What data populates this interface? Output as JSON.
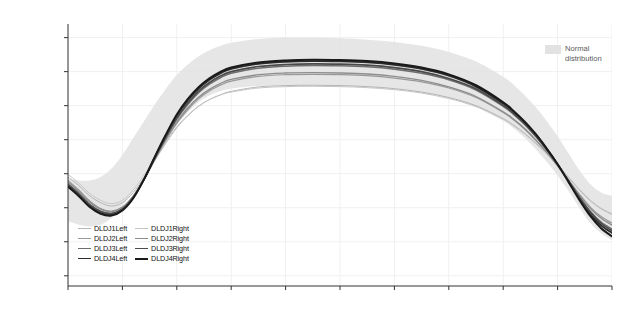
{
  "chart_data": {
    "type": "line",
    "title": "",
    "xlabel": "Percent of movement cycle",
    "ylabel": "Ankle angles (sagittal)\n(-) plantarflexion; (+) dorsiflexion",
    "ylabel_line1": "Ankle angles (sagittal)",
    "ylabel_line2": "(-) plantarflexion; (+) dorsiflexion",
    "xlim": [
      0,
      100
    ],
    "ylim": [
      -33,
      44
    ],
    "xticks": [
      0,
      10,
      20,
      30,
      40,
      50,
      60,
      70,
      80,
      90,
      100
    ],
    "yticks": [
      -30,
      -20,
      -10,
      0,
      10,
      20,
      30,
      40
    ],
    "grid": true,
    "legend_position": "bottom-left",
    "x": [
      0,
      2,
      4,
      6,
      8,
      10,
      12,
      14,
      16,
      18,
      20,
      22,
      24,
      26,
      28,
      30,
      35,
      40,
      45,
      50,
      55,
      60,
      65,
      70,
      75,
      80,
      82,
      84,
      86,
      88,
      90,
      92,
      94,
      96,
      98,
      100
    ],
    "band": {
      "name": "Normal distribution",
      "color": "#e2e2e2",
      "upper": [
        -1.5,
        -2.0,
        -2.0,
        -1.0,
        1.5,
        5.5,
        10.5,
        15.5,
        20.5,
        25.0,
        29.0,
        32.0,
        34.5,
        36.3,
        37.6,
        38.5,
        39.6,
        40.0,
        40.0,
        39.8,
        39.4,
        38.7,
        37.6,
        35.8,
        33.0,
        28.5,
        26.0,
        23.0,
        19.5,
        15.5,
        11.0,
        6.0,
        1.0,
        -3.0,
        -5.5,
        -6.5
      ],
      "lower": [
        -14.0,
        -15.0,
        -15.5,
        -15.0,
        -13.0,
        -9.5,
        -5.0,
        0.0,
        5.0,
        10.0,
        14.5,
        18.0,
        21.0,
        23.0,
        24.3,
        25.0,
        25.8,
        26.0,
        26.0,
        25.8,
        25.4,
        24.8,
        23.8,
        22.2,
        19.6,
        15.5,
        13.2,
        10.5,
        7.2,
        3.5,
        -0.5,
        -5.0,
        -10.0,
        -14.5,
        -17.5,
        -19.5
      ]
    },
    "series": [
      {
        "name": "DLDJ1Left",
        "color": "#b5b5b5",
        "width": 1.0,
        "values": [
          -1.0,
          -3.5,
          -6.5,
          -8.5,
          -9.5,
          -8.5,
          -5.5,
          -1.0,
          4.0,
          9.0,
          13.5,
          17.0,
          19.8,
          21.8,
          23.2,
          24.2,
          25.5,
          25.9,
          26.0,
          25.9,
          25.6,
          25.0,
          24.0,
          22.4,
          20.0,
          16.2,
          14.2,
          11.8,
          9.0,
          6.0,
          2.6,
          -1.0,
          -4.6,
          -7.8,
          -10.2,
          -11.8
        ]
      },
      {
        "name": "DLDJ2Left",
        "color": "#9a9a9a",
        "width": 1.2,
        "values": [
          -2.0,
          -4.8,
          -8.0,
          -10.2,
          -11.0,
          -9.8,
          -6.5,
          -1.5,
          4.2,
          9.8,
          14.8,
          18.8,
          22.0,
          24.3,
          26.0,
          27.2,
          28.6,
          29.1,
          29.2,
          29.1,
          28.8,
          28.1,
          27.0,
          25.2,
          22.4,
          18.0,
          15.7,
          13.0,
          9.8,
          6.3,
          2.4,
          -1.8,
          -6.0,
          -9.8,
          -12.6,
          -14.5
        ]
      },
      {
        "name": "DLDJ3Left",
        "color": "#6e6e6e",
        "width": 1.5,
        "values": [
          -3.0,
          -5.8,
          -9.0,
          -11.0,
          -11.6,
          -10.2,
          -6.8,
          -1.6,
          4.5,
          10.5,
          16.0,
          20.3,
          23.8,
          26.3,
          28.2,
          29.5,
          31.0,
          31.6,
          31.8,
          31.7,
          31.4,
          30.7,
          29.5,
          27.6,
          24.6,
          19.8,
          17.3,
          14.4,
          10.9,
          7.0,
          2.7,
          -2.0,
          -6.8,
          -11.0,
          -14.2,
          -16.3
        ]
      },
      {
        "name": "DLDJ4Left",
        "color": "#2b2b2b",
        "width": 1.8,
        "values": [
          -3.5,
          -6.3,
          -9.5,
          -11.5,
          -12.0,
          -10.5,
          -7.0,
          -1.5,
          5.0,
          11.2,
          17.0,
          21.5,
          25.0,
          27.6,
          29.5,
          30.8,
          32.3,
          32.9,
          33.1,
          33.0,
          32.7,
          32.0,
          30.8,
          28.8,
          25.6,
          20.6,
          18.0,
          15.0,
          11.4,
          7.3,
          2.8,
          -2.2,
          -7.3,
          -11.8,
          -15.2,
          -17.4
        ]
      },
      {
        "name": "DLDJ1Right",
        "color": "#c6c6c6",
        "width": 1.0,
        "values": [
          -0.2,
          -2.8,
          -5.8,
          -7.8,
          -8.8,
          -7.8,
          -4.8,
          -0.3,
          4.6,
          9.4,
          13.8,
          17.2,
          19.9,
          21.8,
          23.1,
          24.0,
          25.2,
          25.6,
          25.7,
          25.6,
          25.3,
          24.7,
          23.7,
          22.1,
          19.7,
          16.0,
          14.0,
          11.6,
          8.8,
          5.8,
          2.4,
          -1.2,
          -4.8,
          -8.0,
          -10.4,
          -12.0
        ]
      },
      {
        "name": "DLDJ2Right",
        "color": "#8d8d8d",
        "width": 1.3,
        "values": [
          -2.4,
          -5.2,
          -8.4,
          -10.5,
          -11.2,
          -9.9,
          -6.6,
          -1.5,
          4.4,
          10.1,
          15.2,
          19.3,
          22.5,
          24.8,
          26.5,
          27.7,
          29.1,
          29.6,
          29.7,
          29.6,
          29.3,
          28.6,
          27.4,
          25.5,
          22.7,
          18.2,
          15.9,
          13.2,
          9.9,
          6.3,
          2.3,
          -2.0,
          -6.3,
          -10.2,
          -13.1,
          -15.1
        ]
      },
      {
        "name": "DLDJ3Right",
        "color": "#4a4a4a",
        "width": 1.7,
        "values": [
          -3.2,
          -6.0,
          -9.2,
          -11.2,
          -11.8,
          -10.4,
          -6.9,
          -1.6,
          4.7,
          10.8,
          16.4,
          20.8,
          24.3,
          26.8,
          28.7,
          30.0,
          31.5,
          32.1,
          32.3,
          32.2,
          31.9,
          31.2,
          30.0,
          28.0,
          25.0,
          20.1,
          17.6,
          14.6,
          11.1,
          7.1,
          2.7,
          -2.1,
          -7.0,
          -11.3,
          -14.6,
          -16.8
        ]
      },
      {
        "name": "DLDJ4Right",
        "color": "#1a1a1a",
        "width": 2.0,
        "values": [
          -3.8,
          -6.6,
          -9.8,
          -11.8,
          -12.3,
          -10.8,
          -7.2,
          -1.6,
          5.1,
          11.5,
          17.4,
          21.9,
          25.4,
          28.0,
          29.9,
          31.2,
          32.7,
          33.3,
          33.5,
          33.4,
          33.1,
          32.4,
          31.2,
          29.2,
          26.0,
          21.0,
          18.3,
          15.2,
          11.6,
          7.4,
          2.8,
          -2.4,
          -7.7,
          -12.4,
          -16.0,
          -18.4
        ]
      }
    ]
  },
  "legend": {
    "items": [
      {
        "label": "DLDJ1Left"
      },
      {
        "label": "DLDJ1Right"
      },
      {
        "label": "DLDJ2Left"
      },
      {
        "label": "DLDJ2Right"
      },
      {
        "label": "DLDJ3Left"
      },
      {
        "label": "DLDJ3Right"
      },
      {
        "label": "DLDJ4Left"
      },
      {
        "label": "DLDJ4Right"
      }
    ]
  },
  "band_legend": {
    "line1": "Normal",
    "line2": "distribution",
    "color": "#e2e2e2"
  },
  "axis": {
    "x_tick_labels": [
      "0",
      "10",
      "20",
      "30",
      "40",
      "50",
      "60",
      "70",
      "80",
      "90",
      "100"
    ],
    "y_tick_labels": [
      "40",
      "30",
      "20",
      "10",
      "0",
      "-10",
      "-20",
      "-30"
    ]
  }
}
